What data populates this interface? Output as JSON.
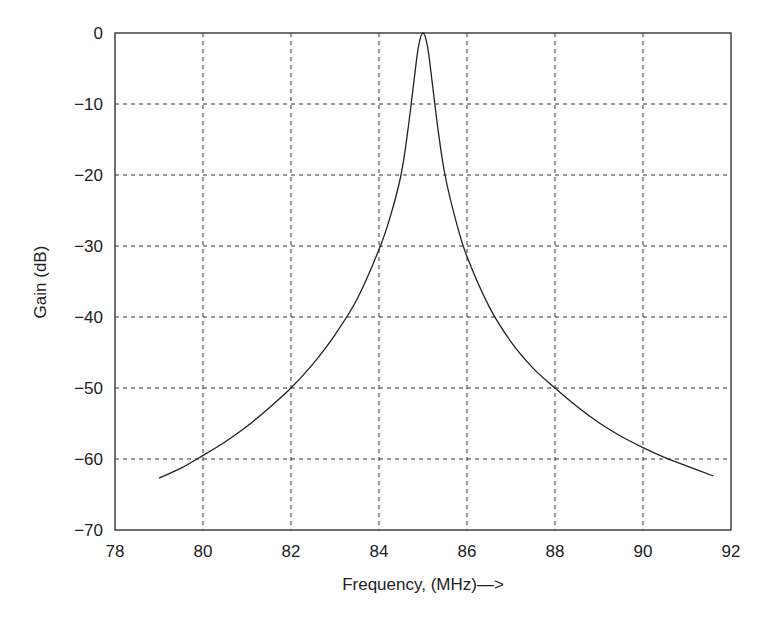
{
  "chart_data": {
    "type": "line",
    "title": "",
    "xlabel": "Frequency, (MHz)—>",
    "ylabel": "Gain (dB)",
    "xlim": [
      78,
      92
    ],
    "ylim": [
      -70,
      0
    ],
    "x_ticks": [
      "78",
      "80",
      "82",
      "84",
      "86",
      "88",
      "90",
      "92"
    ],
    "y_ticks": [
      "0",
      "−10",
      "−20",
      "−30",
      "−40",
      "−50",
      "−60",
      "−70"
    ],
    "grid": true,
    "legend": null,
    "series": [
      {
        "name": "Gain",
        "x": [
          79.0,
          79.5,
          80.0,
          80.5,
          81.0,
          81.5,
          82.0,
          82.5,
          83.0,
          83.5,
          84.0,
          84.25,
          84.5,
          84.65,
          84.8,
          84.9,
          85.0,
          85.1,
          85.2,
          85.35,
          85.5,
          85.75,
          86.0,
          86.5,
          87.0,
          87.5,
          88.0,
          88.5,
          89.0,
          89.5,
          90.0,
          90.5,
          91.0,
          91.6
        ],
        "y": [
          -62.7,
          -61.3,
          -59.5,
          -57.6,
          -55.4,
          -52.8,
          -50.0,
          -46.6,
          -42.5,
          -37.5,
          -30.5,
          -26.0,
          -20.0,
          -14.0,
          -6.5,
          -1.8,
          0.0,
          -1.8,
          -6.5,
          -14.0,
          -20.0,
          -26.5,
          -31.5,
          -38.5,
          -43.5,
          -47.2,
          -50.0,
          -52.6,
          -54.9,
          -56.8,
          -58.4,
          -59.8,
          -61.0,
          -62.4
        ]
      }
    ]
  }
}
